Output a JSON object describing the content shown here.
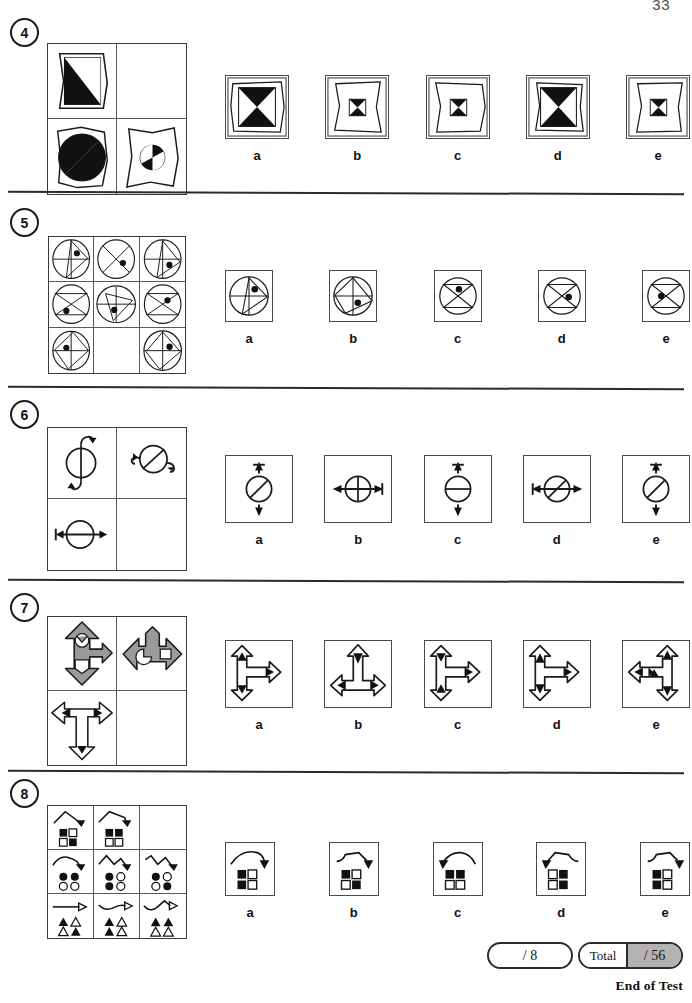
{
  "page": {
    "number": "33",
    "end_note": "End of Test"
  },
  "option_labels": [
    "a",
    "b",
    "c",
    "d",
    "e"
  ],
  "questions": [
    {
      "number": "4",
      "matrix": {
        "rows": 2,
        "cols": 2,
        "description": "2x2 matrix of wobbly-outlined shapes with black fills; bottom-right cell shows a small circle divided into quarters with opposite quarters black; top-right cell is the blank answer cell",
        "cells": [
          {
            "id": "r1c1",
            "shape": "wobbly-square-outline-with-black-diagonal-half-square",
            "blank": false
          },
          {
            "id": "r1c2",
            "shape": "",
            "blank": true
          },
          {
            "id": "r2c1",
            "shape": "wobbly-square-outline-with-black-diagonal-half-circle",
            "blank": false
          },
          {
            "id": "r2c2",
            "shape": "wobbly-square-outline-with-small-quartered-circle",
            "blank": false
          }
        ]
      },
      "options": [
        {
          "label": "a",
          "shape": "large-black-bowtie-in-double-wobbly-frame",
          "size": "large"
        },
        {
          "label": "b",
          "shape": "small-black-bowtie-in-double-wobbly-frame",
          "size": "small"
        },
        {
          "label": "c",
          "shape": "small-black-bowtie-in-double-wobbly-frame",
          "size": "small"
        },
        {
          "label": "d",
          "shape": "large-black-bowtie-in-double-wobbly-frame",
          "size": "large"
        },
        {
          "label": "e",
          "shape": "small-black-bowtie-in-double-wobbly-frame",
          "size": "small"
        }
      ]
    },
    {
      "number": "5",
      "matrix": {
        "rows": 3,
        "cols": 3,
        "description": "3x3 matrix of circles containing inscribed quadrilaterals / crossed lines with a single black dot; middle-bottom cell is the blank answer cell",
        "cells": [
          {
            "id": "r1c1",
            "shape": "circle-cross-with-upper-triangle-dot-upper-right",
            "blank": false
          },
          {
            "id": "r1c2",
            "shape": "circle-diagonal-cross-dot-right",
            "blank": false
          },
          {
            "id": "r1c3",
            "shape": "circle-cross-with-triangle-dot-lower-right",
            "blank": false
          },
          {
            "id": "r2c1",
            "shape": "circle-diagonal-cross-with-bar-dot-lower-left",
            "blank": false
          },
          {
            "id": "r2c2",
            "shape": "circle-cross-with-triangle-dot-center-left",
            "blank": false
          },
          {
            "id": "r2c3",
            "shape": "circle-diagonal-cross-dot-left",
            "blank": false
          },
          {
            "id": "r3c1",
            "shape": "circle-cross-with-triangle-dot-upper-left",
            "blank": false
          },
          {
            "id": "r3c2",
            "shape": "",
            "blank": true
          },
          {
            "id": "r3c3",
            "shape": "circle-cross-with-triangle-dot-upper-right",
            "blank": false
          }
        ]
      },
      "options": [
        {
          "label": "a",
          "shape": "circle-cross-triangle-dot-upper-right"
        },
        {
          "label": "b",
          "shape": "circle-cross-triangle-dot-lower-right"
        },
        {
          "label": "c",
          "shape": "circle-x-cross-with-chord-dot-upper-center"
        },
        {
          "label": "d",
          "shape": "circle-x-cross-dot-right"
        },
        {
          "label": "e",
          "shape": "circle-x-cross-dot-left"
        }
      ]
    },
    {
      "number": "6",
      "matrix": {
        "rows": 2,
        "cols": 2,
        "description": "2x2 matrix of circles bisected by a line with curled or straight double-ended arrows; bottom-right cell is the blank answer cell",
        "cells": [
          {
            "id": "r1c1",
            "shape": "circle-vertical-bisector-with-curled-vertical-arrows",
            "blank": false
          },
          {
            "id": "r1c2",
            "shape": "circle-diagonal-bisector-with-curled-horizontal-arrows",
            "blank": false
          },
          {
            "id": "r2c1",
            "shape": "circle-horizontal-bisector-with-straight-double-arrow",
            "blank": false
          },
          {
            "id": "r2c2",
            "shape": "",
            "blank": true
          }
        ]
      },
      "options": [
        {
          "label": "a",
          "shape": "circle-diagonal-bisector-vertical-double-arrow"
        },
        {
          "label": "b",
          "shape": "circle-vertical-bisector-horizontal-double-arrow"
        },
        {
          "label": "c",
          "shape": "circle-horizontal-bisector-vertical-double-arrow"
        },
        {
          "label": "d",
          "shape": "circle-diagonal-bisector-horizontal-double-arrow"
        },
        {
          "label": "e",
          "shape": "circle-diagonal-bisector-vertical-double-arrow"
        }
      ]
    },
    {
      "number": "7",
      "matrix": {
        "rows": 2,
        "cols": 2,
        "description": "2x2 matrix of multi-headed arrow crosses; top row grey-filled, bottom-left white-filled with black arrowheads; bottom-right cell is the blank answer cell",
        "cells": [
          {
            "id": "r1c1",
            "shape": "grey-vertical-cross-arrow-with-notched-circle-and-square",
            "blank": false
          },
          {
            "id": "r1c2",
            "shape": "grey-horizontal-cross-arrow-with-notched-circle-and-square",
            "blank": false
          },
          {
            "id": "r2c1",
            "shape": "white-t-arrow-left-right-down-with-black-arrowheads",
            "blank": false
          },
          {
            "id": "r2c2",
            "shape": "",
            "blank": true
          }
        ]
      },
      "options": [
        {
          "label": "a",
          "shape": "arrow-cross-up-down-right-black-heads-up-down"
        },
        {
          "label": "b",
          "shape": "arrow-cross-up-left-right-black-heads-all"
        },
        {
          "label": "c",
          "shape": "arrow-cross-up-down-right-black-heads-all"
        },
        {
          "label": "d",
          "shape": "arrow-cross-up-down-right-black-heads-all-alt"
        },
        {
          "label": "e",
          "shape": "arrow-cross-up-down-left-right-black-heads-left-center-right"
        }
      ]
    },
    {
      "number": "8",
      "matrix": {
        "rows": 3,
        "cols": 3,
        "description": "3x3 matrix; each cell has a squiggly line with an arrowhead above a 2x2 group of small shapes (squares / circles / triangles) with varying black and white fills; top-right cell is the blank answer cell",
        "cells": [
          {
            "id": "r1c1",
            "shape": "peak-line-arrow-over-squares-BW-WB",
            "blank": false
          },
          {
            "id": "r1c2",
            "shape": "peak-line-arrow-over-squares-BB-WW",
            "blank": false
          },
          {
            "id": "r1c3",
            "shape": "",
            "blank": true
          },
          {
            "id": "r2c1",
            "shape": "curve-line-arrow-over-circles-BB-WW",
            "blank": false
          },
          {
            "id": "r2c2",
            "shape": "zigzag-line-arrow-over-circles-BW-BW",
            "blank": false
          },
          {
            "id": "r2c3",
            "shape": "zigzag-line-arrow-over-circles-BW-WB",
            "blank": false
          },
          {
            "id": "r3c1",
            "shape": "straight-line-arrow-over-triangles-BW-WB",
            "blank": false
          },
          {
            "id": "r3c2",
            "shape": "wave-line-arrow-over-triangles-BW-BW",
            "blank": false
          },
          {
            "id": "r3c3",
            "shape": "wave-line-arrow-over-triangles-BB-WW",
            "blank": false
          }
        ]
      },
      "options": [
        {
          "label": "a",
          "shape": "arc-arrow-right-over-squares-BW-BW"
        },
        {
          "label": "b",
          "shape": "plateau-arrow-right-over-squares-BW-WB"
        },
        {
          "label": "c",
          "shape": "arc-arrow-left-over-squares-BB-WW"
        },
        {
          "label": "d",
          "shape": "plateau-arrow-left-over-squares-WB-WB"
        },
        {
          "label": "e",
          "shape": "plateau-arrow-right-over-squares-BW-BW"
        }
      ]
    }
  ],
  "score": {
    "question_score": "/ 8",
    "total_label": "Total",
    "total_score": "/ 56"
  }
}
